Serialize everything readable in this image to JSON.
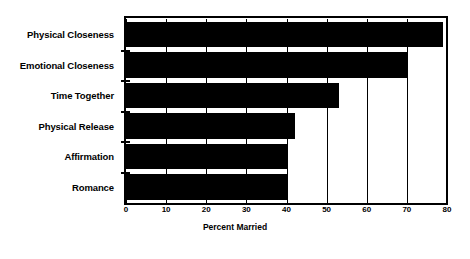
{
  "chart_data": {
    "type": "bar",
    "orientation": "horizontal",
    "title": "",
    "xlabel": "Percent Married",
    "ylabel": "",
    "categories": [
      "Physical Closeness",
      "Emotional Closeness",
      "Time Together",
      "Physical Release",
      "Affirmation",
      "Romance"
    ],
    "values": [
      79,
      70,
      53,
      42,
      40,
      40
    ],
    "xlim": [
      0,
      80
    ],
    "xticks": [
      0,
      10,
      20,
      30,
      40,
      50,
      60,
      70,
      80
    ],
    "xtick_labels": [
      "0",
      "10",
      "20",
      "30",
      "40",
      "50",
      "60",
      "70",
      "80"
    ],
    "grid": true,
    "legend": null,
    "bar_color": "#000000",
    "background_color": "#ffffff"
  }
}
